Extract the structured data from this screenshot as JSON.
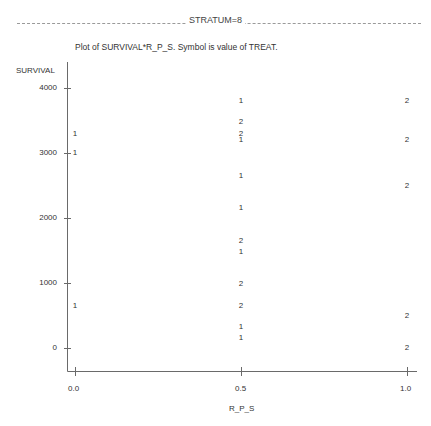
{
  "header": {
    "stratum_label": "STRATUM=8",
    "plot_title": "Plot of SURVIVAL*R_P_S.  Symbol is value of TREAT."
  },
  "axes": {
    "y_label": "SURVIVAL",
    "x_label": "R_P_S",
    "y_ticks": [
      "4000",
      "3000",
      "2000",
      "1000",
      "0"
    ],
    "x_ticks": [
      "0.0",
      "0.5",
      "1.0"
    ]
  },
  "chart_data": {
    "type": "scatter",
    "title": "Plot of SURVIVAL*R_P_S.  Symbol is value of TREAT.",
    "subtitle": "STRATUM=8",
    "xlabel": "R_P_S",
    "ylabel": "SURVIVAL",
    "xlim": [
      0.0,
      1.0
    ],
    "ylim": [
      -400,
      4200
    ],
    "x_ticks": [
      0.0,
      0.5,
      1.0
    ],
    "y_ticks": [
      0,
      1000,
      2000,
      3000,
      4000
    ],
    "grid": false,
    "legend": "Symbol is value of TREAT",
    "series": [
      {
        "name": "TREAT=1",
        "symbol": "1",
        "points": [
          {
            "x": 0.0,
            "y": 3300
          },
          {
            "x": 0.0,
            "y": 3000
          },
          {
            "x": 0.0,
            "y": 650
          },
          {
            "x": 0.5,
            "y": 3800
          },
          {
            "x": 0.5,
            "y": 3200
          },
          {
            "x": 0.5,
            "y": 2650
          },
          {
            "x": 0.5,
            "y": 2150
          },
          {
            "x": 0.5,
            "y": 1480
          },
          {
            "x": 0.5,
            "y": 330
          },
          {
            "x": 0.5,
            "y": 160
          }
        ]
      },
      {
        "name": "TREAT=2",
        "symbol": "2",
        "points": [
          {
            "x": 0.5,
            "y": 3470
          },
          {
            "x": 0.5,
            "y": 3300
          },
          {
            "x": 0.5,
            "y": 1640
          },
          {
            "x": 0.5,
            "y": 980
          },
          {
            "x": 0.5,
            "y": 650
          },
          {
            "x": 1.0,
            "y": 3800
          },
          {
            "x": 1.0,
            "y": 3200
          },
          {
            "x": 1.0,
            "y": 2500
          },
          {
            "x": 1.0,
            "y": 500
          },
          {
            "x": 1.0,
            "y": 0
          }
        ]
      }
    ]
  }
}
